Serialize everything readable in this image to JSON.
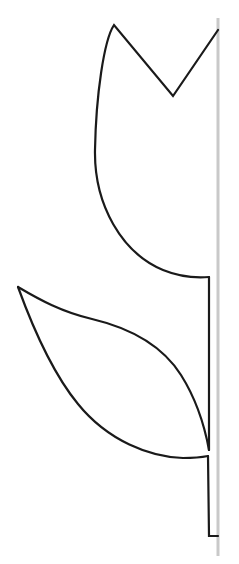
{
  "figure": {
    "title": "Tulip Half Outline",
    "description": "Black line-art outline of one half of a tulip flower with a single leaf, drawn against a vertical gray fold line on the right side.",
    "style": "line-art-outline",
    "background_color": "#ffffff",
    "canvas": {
      "width": 239,
      "height": 564
    }
  },
  "colors": {
    "outline": "#1a1a1a",
    "fold_line": "#c9c9c9",
    "background": "#ffffff"
  },
  "strokes": {
    "outline_width": 2.2,
    "fold_line_width": 3
  },
  "fold_line": {
    "name": "fold-line",
    "orientation": "vertical",
    "x": 218,
    "y_start": 18,
    "y_end": 556,
    "color": "#c9c9c9"
  },
  "parts": [
    {
      "name": "flower-petal",
      "label": "Tulip blossom half",
      "key_points": {
        "left_peak": {
          "x": 114,
          "y": 25
        },
        "notch_vertex": {
          "x": 173,
          "y": 96
        },
        "right_top": {
          "x": 218,
          "y": 30
        },
        "leftmost": {
          "x": 95,
          "y": 162
        },
        "base_right": {
          "x": 209,
          "y": 277
        }
      }
    },
    {
      "name": "leaf",
      "label": "Tulip leaf half",
      "key_points": {
        "tip": {
          "x": 18,
          "y": 287
        },
        "upper_curve_control": {
          "x": 110,
          "y": 322
        },
        "stem_join_upper": {
          "x": 209,
          "y": 450
        },
        "lower_curve_control": {
          "x": 100,
          "y": 432
        },
        "stem_join_lower": {
          "x": 208,
          "y": 456
        }
      }
    },
    {
      "name": "stem",
      "label": "Tulip stem half",
      "key_points": {
        "top": {
          "x": 209,
          "y": 277
        },
        "bottom": {
          "x": 209,
          "y": 536
        },
        "foot_right": {
          "x": 218,
          "y": 536
        }
      }
    }
  ],
  "paths": {
    "petal": "M 218 30 L 173 96 L 114 25 C 104 40 96 95 95 150 C 94 205 122 253 163 270 C 180 277 196 278 209 277",
    "stem_upper": "M 209 277 L 209 450",
    "leaf_upper": "M 18 287 C 40 300 62 312 92 319 C 130 328 162 345 181 375 C 198 402 205 428 209 450",
    "leaf_lower": "M 18 287 C 30 320 50 370 78 404 C 108 441 150 457 183 458 C 195 458 203 457 208 456",
    "stem_lower": "M 208 456 L 209 536 L 218 536",
    "fold": "M 218 18 L 218 556"
  }
}
